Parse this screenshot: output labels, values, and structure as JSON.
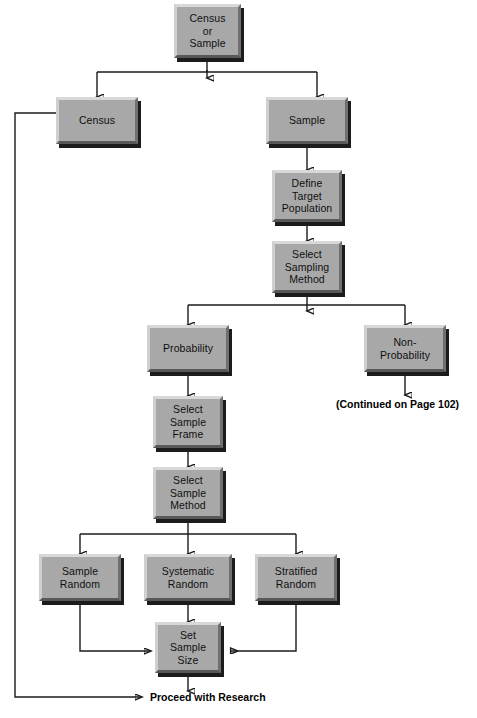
{
  "diagram": {
    "line_color": "#1b1b1b",
    "box_face_color": "#a8a8a8",
    "box_highlight_color": "#d8d8d8",
    "box_shadow_color": "#1c1c1c",
    "text_color": "#101010"
  },
  "nodes": {
    "census_or_sample": {
      "label": "Census\nor\nSample"
    },
    "census": {
      "label": "Census"
    },
    "sample": {
      "label": "Sample"
    },
    "define_target_population": {
      "label": "Define\nTarget\nPopulation"
    },
    "select_sampling_method": {
      "label": "Select\nSampling\nMethod"
    },
    "probability": {
      "label": "Probability"
    },
    "non_probability": {
      "label": "Non-\nProbability"
    },
    "select_sample_frame": {
      "label": "Select\nSample\nFrame"
    },
    "select_sample_method": {
      "label": "Select\nSample\nMethod"
    },
    "sample_random": {
      "label": "Sample\nRandom"
    },
    "systematic_random": {
      "label": "Systematic\nRandom"
    },
    "stratified_random": {
      "label": "Stratified\nRandom"
    },
    "set_sample_size": {
      "label": "Set\nSample\nSize"
    }
  },
  "labels": {
    "continued": "(Continued on Page 102)",
    "proceed": "Proceed with Research"
  }
}
